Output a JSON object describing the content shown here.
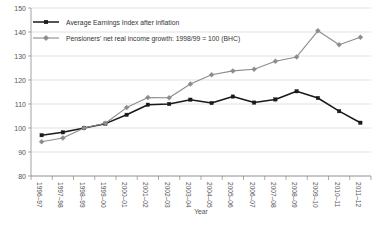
{
  "chart_data": {
    "type": "line",
    "title": "",
    "xlabel": "Year",
    "ylabel": "",
    "ylim": [
      80,
      150
    ],
    "ytick_step": 10,
    "grid": true,
    "legend_position": "top-left",
    "categories": [
      "1996–97",
      "1997–98",
      "1998–99",
      "1999–00",
      "2000–01",
      "2001–02",
      "2002–03",
      "2003–04",
      "2004–05",
      "2005–06",
      "2006–07",
      "2007–08",
      "2008–09",
      "2009–10",
      "2010–11",
      "2011–12"
    ],
    "yticks": [
      "80",
      "90",
      "100",
      "110",
      "120",
      "130",
      "140",
      "150"
    ],
    "series": [
      {
        "name": "Average Earnings Index after inflation",
        "color": "#1a1a1a",
        "marker": "square",
        "values": [
          97.0,
          98.2,
          100.0,
          101.8,
          105.5,
          109.7,
          110.0,
          111.8,
          110.4,
          113.1,
          110.6,
          111.9,
          115.3,
          112.5,
          107.0,
          102.2
        ]
      },
      {
        "name": "Pensioners' net real income growth: 1998/99 = 100 (BHC)",
        "color": "#8c8c8c",
        "marker": "diamond",
        "values": [
          94.3,
          95.8,
          100.0,
          102.0,
          108.5,
          112.7,
          112.6,
          118.3,
          122.2,
          123.8,
          124.5,
          127.8,
          129.6,
          140.5,
          134.7,
          137.8
        ]
      }
    ]
  }
}
